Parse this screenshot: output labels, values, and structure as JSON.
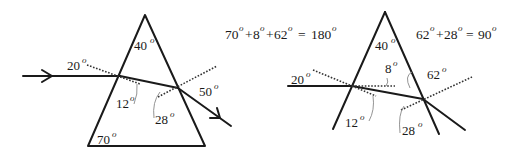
{
  "left_prism": {
    "apex_angle": "40",
    "base_angle": "70",
    "incidence_angle": "20",
    "refraction_angle": "12",
    "internal_angle": "28",
    "emergence_angle": "50"
  },
  "right_prism": {
    "apex_angle": "40",
    "incidence_angle": "20",
    "deviation_angle": "8",
    "refraction_angle": "12",
    "angle_62": "62",
    "internal_angle": "28"
  },
  "equations": {
    "eq1": {
      "terms": [
        "70",
        "8",
        "62"
      ],
      "ops": [
        "+",
        "+"
      ],
      "result": "180"
    },
    "eq2": {
      "terms": [
        "62",
        "28"
      ],
      "ops": [
        "+"
      ],
      "result": "90"
    }
  },
  "degree_symbol": "o",
  "equals": "="
}
